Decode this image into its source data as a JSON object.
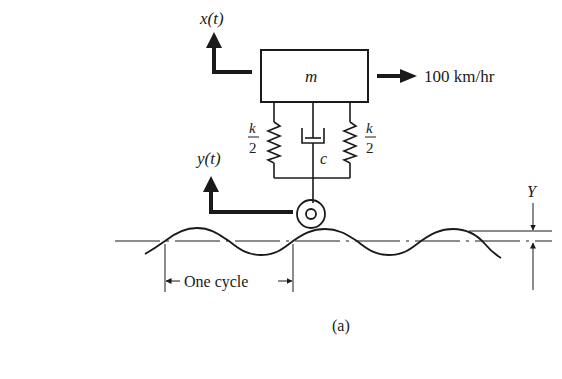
{
  "diagram": {
    "type": "quarter-car vehicle model on sinusoidal road",
    "labels": {
      "mass_displacement": "x(t)",
      "mass": "m",
      "velocity": "100 km/hr",
      "left_spring_num": "k",
      "left_spring_den": "2",
      "right_spring_num": "k",
      "right_spring_den": "2",
      "damper": "c",
      "base_displacement": "y(t)",
      "amplitude": "Y",
      "wavelength": "One cycle",
      "caption": "(a)"
    },
    "components": [
      {
        "id": "mass",
        "label": "m"
      },
      {
        "id": "spring-left",
        "label": "k/2"
      },
      {
        "id": "damper",
        "label": "c"
      },
      {
        "id": "spring-right",
        "label": "k/2"
      },
      {
        "id": "wheel"
      },
      {
        "id": "road",
        "shape": "sine wave"
      }
    ],
    "colors": {
      "ink": "#1a1a1a",
      "background": "#ffffff"
    }
  }
}
